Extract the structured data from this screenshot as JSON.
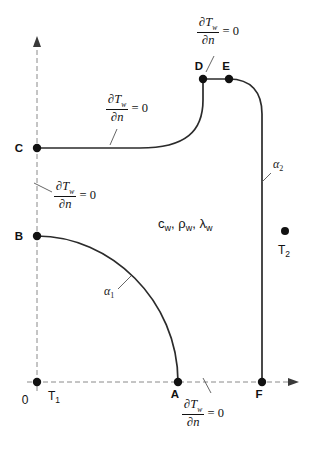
{
  "figure": {
    "type": "boundary-condition-schematic",
    "background_color": "#ffffff",
    "line_color": "#2b2b2b",
    "axis_color": "#8a8a8a"
  },
  "axes": {
    "origin_label": "0",
    "x_axis": {
      "name": "x-axis",
      "style": "dashed-with-arrow"
    },
    "y_axis": {
      "name": "y-axis",
      "style": "dashed-with-arrow"
    }
  },
  "nodes": [
    {
      "id": "A",
      "label": "A",
      "x": 178,
      "y": 382,
      "label_dx": -3,
      "label_dy": 16
    },
    {
      "id": "B",
      "label": "B",
      "x": 37,
      "y": 236,
      "label_dx": -18,
      "label_dy": 4
    },
    {
      "id": "C",
      "label": "C",
      "x": 37,
      "y": 148,
      "label_dx": -18,
      "label_dy": 4
    },
    {
      "id": "D",
      "label": "D",
      "x": 203,
      "y": 79,
      "label_dx": -4,
      "label_dy": -9
    },
    {
      "id": "E",
      "label": "E",
      "x": 229,
      "y": 79,
      "label_dx": -3,
      "label_dy": -9
    },
    {
      "id": "F",
      "label": "F",
      "x": 262,
      "y": 382,
      "label_dx": -3,
      "label_dy": 16
    },
    {
      "id": "T2dot",
      "label": "",
      "x": 285,
      "y": 231,
      "label_dx": 0,
      "label_dy": 0
    },
    {
      "id": "O",
      "label": "",
      "x": 37,
      "y": 382,
      "label_dx": 0,
      "label_dy": 0
    }
  ],
  "temperatures": [
    {
      "name": "T1",
      "base": "T",
      "subscript": "1",
      "x": 48,
      "y": 400
    },
    {
      "name": "T2",
      "base": "T",
      "subscript": "2",
      "x": 278,
      "y": 254
    }
  ],
  "heat_transfer_coefficients": [
    {
      "name": "alpha1",
      "base": "α",
      "subscript": "1",
      "x": 104,
      "y": 295,
      "leader": "M 118 289 L 131 276"
    },
    {
      "name": "alpha2",
      "base": "α",
      "subscript": "2",
      "x": 273,
      "y": 168,
      "leader": "M 271 173 L 262 182"
    }
  ],
  "material_properties": {
    "text": "c_w, ρ_w, λ_w",
    "items": [
      {
        "base": "c",
        "subscript": "w"
      },
      {
        "base": "ρ",
        "subscript": "w"
      },
      {
        "base": "λ",
        "subscript": "w"
      }
    ],
    "x": 158,
    "y": 228
  },
  "boundary_conditions": [
    {
      "id": "bc-top-de",
      "numerator": "∂T",
      "numerator_sub": "w",
      "denominator": "∂n",
      "equals": "= 0",
      "x": 197,
      "y": 16,
      "leader": "M 214 56 L 206 72"
    },
    {
      "id": "bc-upper-c",
      "numerator": "∂T",
      "numerator_sub": "w",
      "denominator": "∂n",
      "equals": "= 0",
      "x": 106,
      "y": 93,
      "leader": "M 117 129 L 110 145"
    },
    {
      "id": "bc-left-bc",
      "numerator": "∂T",
      "numerator_sub": "w",
      "denominator": "∂n",
      "equals": "= 0",
      "x": 54,
      "y": 180,
      "leader": "M 52 192 L 34 183"
    },
    {
      "id": "bc-bottom-af",
      "numerator": "∂T",
      "numerator_sub": "w",
      "denominator": "∂n",
      "equals": "= 0",
      "x": 182,
      "y": 398,
      "leader": "M 211 393 L 203 378"
    }
  ],
  "geometry": {
    "y_axis_path": "M 37 42 L 37 392",
    "y_axis_arrow": "M 37 36 L 33 47 L 41 47 Z",
    "x_axis_path": "M 27 382 L 293 382",
    "x_axis_arrow": "M 299 382 L 288 378 L 288 386 Z",
    "arc_ba": "M 37 236 C 110 236 178 300 178 382",
    "wall_cdef": "M 37 148 L 140 148 C 186 148 203 131 203 100 L 203 79 L 229 79 C 251 79 262 92 262 114 L 262 382"
  }
}
